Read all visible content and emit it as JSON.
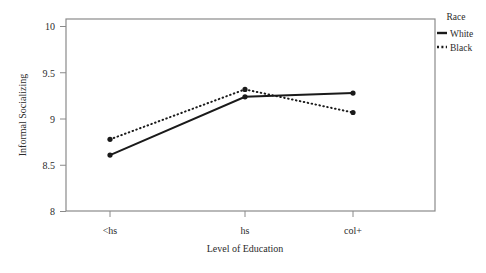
{
  "chart_data": {
    "type": "line",
    "title": "",
    "xlabel": "Level of Education",
    "ylabel": "Informal Socializing",
    "categories": [
      "<hs",
      "hs",
      "col+"
    ],
    "ylim": [
      8,
      10
    ],
    "yticks": [
      "8",
      "8.5",
      "9",
      "9.5",
      "10"
    ],
    "ytick_values": [
      8,
      8.5,
      9,
      9.5,
      10
    ],
    "grid": false,
    "legend_position": "right",
    "legend_title": "Race",
    "series": [
      {
        "name": "White",
        "values": [
          8.61,
          9.24,
          9.28
        ],
        "style": "solid",
        "color": "#1a1a1a",
        "marker": "circle"
      },
      {
        "name": "Black",
        "values": [
          8.78,
          9.32,
          9.07
        ],
        "style": "dotted",
        "color": "#1a1a1a",
        "marker": "circle"
      }
    ]
  },
  "axes": {
    "y_tick_0": "8",
    "y_tick_1": "8.5",
    "y_tick_2": "9",
    "y_tick_3": "9.5",
    "y_tick_4": "10",
    "x_tick_0": "<hs",
    "x_tick_1": "hs",
    "x_tick_2": "col+",
    "x_axis_title": "Level of Education",
    "y_axis_title": "Informal Socializing"
  },
  "legend": {
    "title": "Race",
    "items": [
      {
        "label": "White",
        "style": "solid"
      },
      {
        "label": "Black",
        "style": "dotted"
      }
    ]
  },
  "style": {
    "frame_color": "#8a8a8a",
    "line_color": "#1a1a1a",
    "background": "#ffffff"
  }
}
